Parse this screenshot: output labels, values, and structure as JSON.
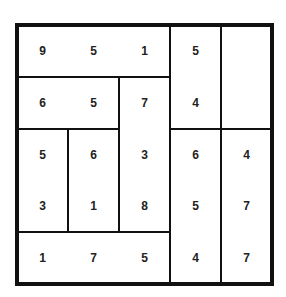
{
  "puzzle": {
    "rows": 5,
    "cols": 5,
    "grid": [
      [
        "9",
        "5",
        "1",
        "5",
        ""
      ],
      [
        "6",
        "5",
        "7",
        "4",
        ""
      ],
      [
        "5",
        "6",
        "3",
        "6",
        "4"
      ],
      [
        "3",
        "1",
        "8",
        "5",
        "7"
      ],
      [
        "1",
        "7",
        "5",
        "4",
        "7"
      ]
    ],
    "regions": [
      {
        "name": "r-top-row",
        "r": 0,
        "c": 0,
        "h": 1,
        "w": 3
      },
      {
        "name": "r-col3-top",
        "r": 0,
        "c": 3,
        "h": 2,
        "w": 1
      },
      {
        "name": "r-col4-top",
        "r": 0,
        "c": 4,
        "h": 2,
        "w": 1
      },
      {
        "name": "r-row1-left",
        "r": 1,
        "c": 0,
        "h": 1,
        "w": 2
      },
      {
        "name": "r-col2-mid",
        "r": 1,
        "c": 2,
        "h": 3,
        "w": 1
      },
      {
        "name": "r-col0-mid",
        "r": 2,
        "c": 0,
        "h": 2,
        "w": 1
      },
      {
        "name": "r-col1-mid",
        "r": 2,
        "c": 1,
        "h": 2,
        "w": 1
      },
      {
        "name": "r-bottom-row",
        "r": 4,
        "c": 0,
        "h": 1,
        "w": 3
      },
      {
        "name": "r-col3-bottom",
        "r": 2,
        "c": 3,
        "h": 3,
        "w": 1
      },
      {
        "name": "r-col4-bottom",
        "r": 2,
        "c": 4,
        "h": 3,
        "w": 1
      }
    ]
  }
}
